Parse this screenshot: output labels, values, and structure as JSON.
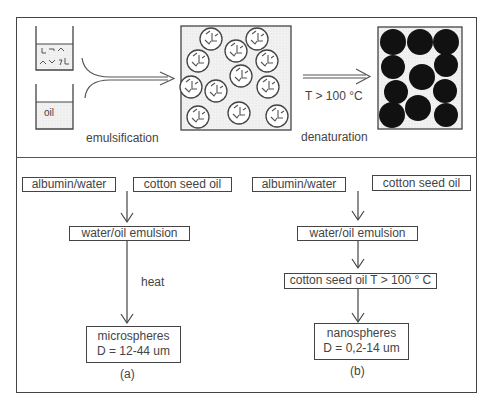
{
  "top_panel": {
    "beaker_water_content": "protein (albumin/water) fragments",
    "beaker_oil_label": "oil",
    "step1_label": "emulsification",
    "step2_condition": "T > 100 °C",
    "step2_label": "denaturation",
    "emulsion_box": "droplets with protein fragments",
    "result_box": "solid black spheres"
  },
  "flow_a": {
    "input1": "albumin/water",
    "input2": "cotton seed oil",
    "intermediate": "water/oil emulsion",
    "process_label": "heat",
    "result_line1": "microspheres",
    "result_line2": "D = 12-44 um",
    "caption": "(a)"
  },
  "flow_b": {
    "input1": "albumin/water",
    "input2": "cotton seed oil",
    "intermediate": "water/oil emulsion",
    "process_box": "cotton seed oil  T > 100 ° C",
    "result_line1": "nanospheres",
    "result_line2": "D = 0,2-14 um",
    "caption": "(b)"
  }
}
